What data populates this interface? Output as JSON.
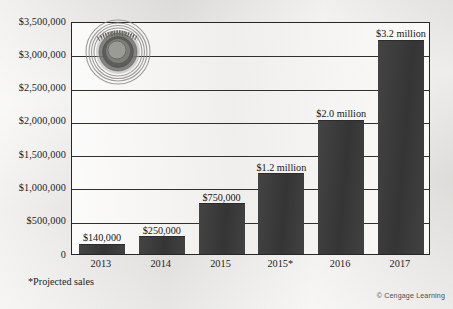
{
  "chart_data": {
    "type": "bar",
    "title": "",
    "xlabel": "",
    "ylabel": "",
    "categories": [
      "2013",
      "2014",
      "2015",
      "2015*",
      "2016",
      "2017"
    ],
    "values": [
      140000,
      250000,
      750000,
      1200000,
      2000000,
      3200000
    ],
    "data_labels": [
      "$140,000",
      "$250,000",
      "$750,000",
      "$1.2 million",
      "$2.0 million",
      "$3.2 million"
    ],
    "ylim": [
      0,
      3500000
    ],
    "ytick_values": [
      3500000,
      3000000,
      2500000,
      2000000,
      1500000,
      1000000,
      500000,
      0
    ],
    "ytick_labels": [
      "$3,500,000",
      "$3,000,000",
      "$2,500,000",
      "$2,000,000",
      "$1,500,000",
      "$1,000,000",
      "$500,000",
      "0"
    ],
    "grid": true,
    "legend": "none",
    "series": [
      {
        "name": "Sales",
        "values": [
          140000,
          250000,
          750000,
          1200000,
          2000000,
          3200000
        ]
      }
    ],
    "annotations": {
      "footnote": "*Projected sales",
      "copyright": "© Cengage Learning"
    },
    "colors": {
      "bar": "#3a3a3a",
      "plot_background": "#f4f3f1",
      "page_background": "#e9e8e5",
      "gridline": "#30302f",
      "axis": "#262626",
      "text": "#1d1d1d"
    }
  },
  "watermark": {
    "name": "circular-logo-watermark"
  }
}
